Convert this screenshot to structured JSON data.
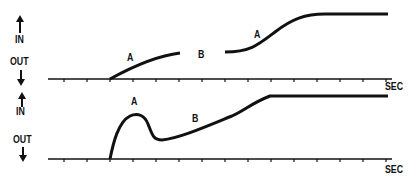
{
  "panels": [
    {
      "id": "top",
      "y_label_in": "IN",
      "y_label_out": "OUT",
      "x_label": "SEC",
      "curve_labels": [
        "A",
        "B",
        "A"
      ],
      "description": "Response with a gap: rise A, interruption B, second rise A to plateau"
    },
    {
      "id": "bottom",
      "y_label_in": "IN",
      "y_label_out": "OUT",
      "x_label": "SEC",
      "curve_labels": [
        "A",
        "B"
      ],
      "description": "Response with overshoot peak A, dip, then gradual rise B to plateau"
    }
  ],
  "colors": {
    "ink": "#111111",
    "background": "#ffffff"
  }
}
